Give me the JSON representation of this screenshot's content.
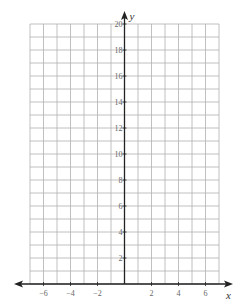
{
  "chart_data": {
    "type": "line",
    "title": "",
    "xlabel": "x",
    "ylabel": "y",
    "xlim": [
      -7,
      7
    ],
    "ylim": [
      0,
      20
    ],
    "grid": true,
    "grid_step_x": 1,
    "grid_step_y": 1,
    "x_ticks": [
      -6,
      -4,
      -2,
      2,
      4,
      6
    ],
    "x_tick_labels": [
      "−6",
      "−4",
      "−2",
      "2",
      "4",
      "6"
    ],
    "y_ticks": [
      2,
      4,
      6,
      8,
      10,
      12,
      14,
      16,
      18,
      20
    ],
    "y_tick_labels": [
      "2",
      "4",
      "6",
      "8",
      "10",
      "12",
      "14",
      "16",
      "18",
      "20"
    ],
    "series": [],
    "legend": null
  },
  "colors": {
    "grid": "#b0b0b0",
    "axis": "#222222",
    "tick_label": "#666666"
  },
  "labels": {
    "x_axis": "x",
    "y_axis": "y"
  }
}
